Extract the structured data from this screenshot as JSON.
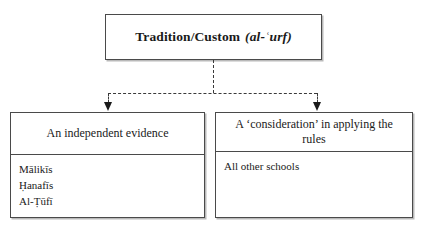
{
  "diagram": {
    "type": "flowchart",
    "root": {
      "label_roman": "Tradition/Custom",
      "label_transliteration": "(al-ʿurf)"
    },
    "connectors": {
      "style": "dashed",
      "arrowhead": "solid-triangle",
      "from": "root",
      "to": [
        "branch_independent_evidence",
        "branch_consideration"
      ]
    },
    "branches": [
      {
        "id": "branch_independent_evidence",
        "heading": "An independent evidence",
        "entries": [
          "Mālikīs",
          "Ḥanafīs",
          "Al-Ṭūfī"
        ]
      },
      {
        "id": "branch_consideration",
        "heading": "A ‘consideration’ in applying the rules",
        "entries": [
          "All other schools"
        ]
      }
    ]
  }
}
